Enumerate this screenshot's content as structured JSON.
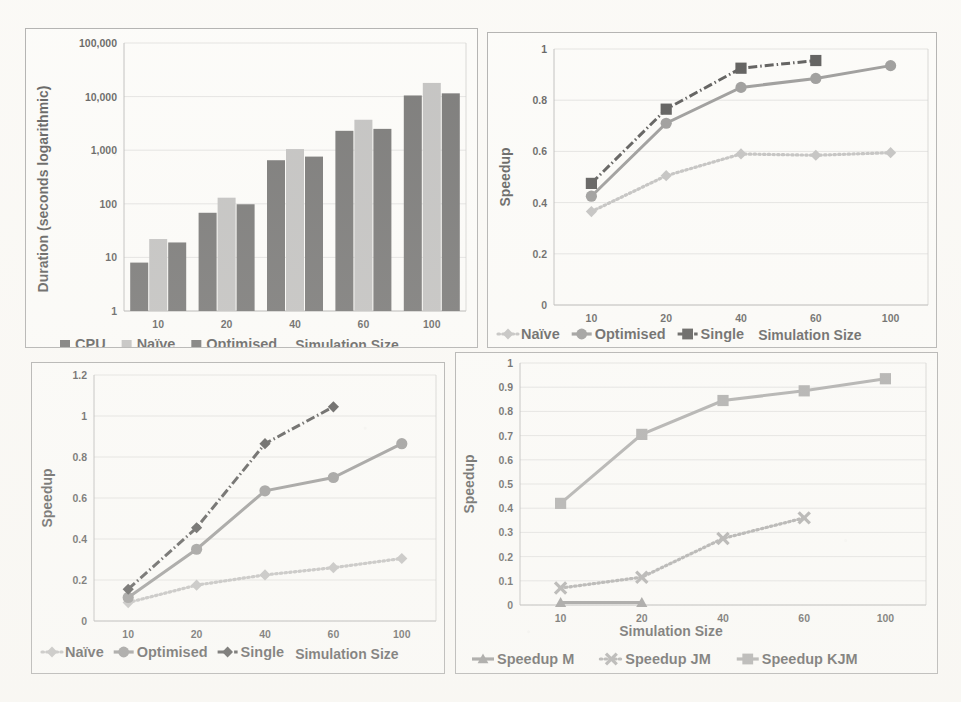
{
  "page": {
    "background_color": "#fbfaf7",
    "panel_background": "#fdfdfb",
    "panel_border_color": "#8f8f8f",
    "layout": "2x2 grid of charts on a scanned page"
  },
  "palette": {
    "dark_gray": "#3b3b3b",
    "light_gray": "#a8a8a8",
    "mid_gray": "#6f6f6f",
    "black": "#111111",
    "gridline": "#cfcfcf",
    "axis": "#9a9a9a"
  },
  "charts": [
    {
      "id": "duration-bar-chart",
      "position": "top-left",
      "chart_data": {
        "type": "bar",
        "title": "",
        "xlabel": "Simulation Size",
        "ylabel": "Duration (seconds logarithmic)",
        "categories": [
          "10",
          "20",
          "40",
          "60",
          "100"
        ],
        "yscale": "log",
        "ylim": [
          1,
          100000
        ],
        "yticks": [
          "1",
          "10",
          "100",
          "1,000",
          "10,000",
          "100,000"
        ],
        "ytick_values": [
          1,
          10,
          100,
          1000,
          10000,
          100000
        ],
        "grid": true,
        "legend_position": "bottom-left",
        "series": [
          {
            "name": "CPU",
            "color": "#3b3b3b",
            "marker": "square",
            "values": [
              8,
              68,
              650,
              2300,
              10500
            ]
          },
          {
            "name": "Naïve",
            "color": "#a8a8a8",
            "marker": "square",
            "values": [
              22,
              130,
              1050,
              3700,
              18000
            ]
          },
          {
            "name": "Optimised",
            "color": "#3b3b3b",
            "marker": "square",
            "values": [
              19,
              98,
              760,
              2500,
              11500
            ]
          }
        ]
      }
    },
    {
      "id": "speedup-multi-chart",
      "position": "top-right",
      "chart_data": {
        "type": "line",
        "title": "",
        "xlabel": "Simulation Size",
        "ylabel": "Speedup",
        "categories": [
          "10",
          "20",
          "40",
          "60",
          "100"
        ],
        "ylim": [
          0,
          1
        ],
        "yticks": [
          "0",
          "0.2",
          "0.4",
          "0.6",
          "0.8",
          "1"
        ],
        "ytick_values": [
          0,
          0.2,
          0.4,
          0.6,
          0.8,
          1
        ],
        "grid": true,
        "legend_position": "bottom-left",
        "series": [
          {
            "name": "Naïve",
            "color": "#a8a8a8",
            "marker": "diamond",
            "style": "dotted",
            "values": [
              0.365,
              0.505,
              0.59,
              0.585,
              0.595
            ]
          },
          {
            "name": "Optimised",
            "color": "#6f6f6f",
            "marker": "circle",
            "style": "solid",
            "values": [
              0.425,
              0.71,
              0.85,
              0.885,
              0.935
            ]
          },
          {
            "name": "Single",
            "color": "#111111",
            "marker": "square",
            "style": "dashdot",
            "values": [
              0.475,
              0.765,
              0.925,
              0.955,
              null
            ]
          }
        ]
      }
    },
    {
      "id": "speedup-scaling-chart",
      "position": "bottom-left",
      "chart_data": {
        "type": "line",
        "title": "",
        "xlabel": "Simulation Size",
        "ylabel": "Speedup",
        "categories": [
          "10",
          "20",
          "40",
          "60",
          "100"
        ],
        "ylim": [
          0,
          1.2
        ],
        "yticks": [
          "0",
          "0.2",
          "0.4",
          "0.6",
          "0.8",
          "1",
          "1.2"
        ],
        "ytick_values": [
          0,
          0.2,
          0.4,
          0.6,
          0.8,
          1,
          1.2
        ],
        "grid": true,
        "legend_position": "bottom-left",
        "series": [
          {
            "name": "Naïve",
            "color": "#a8a8a8",
            "marker": "diamond",
            "style": "dotted",
            "values": [
              0.09,
              0.175,
              0.225,
              0.26,
              0.305
            ]
          },
          {
            "name": "Optimised",
            "color": "#6f6f6f",
            "marker": "circle",
            "style": "solid",
            "values": [
              0.115,
              0.35,
              0.635,
              0.7,
              0.865
            ]
          },
          {
            "name": "Single",
            "color": "#111111",
            "marker": "diamond",
            "style": "dashdot",
            "values": [
              0.155,
              0.455,
              0.865,
              1.045,
              null
            ]
          }
        ]
      }
    },
    {
      "id": "speedup-mjm-chart",
      "position": "bottom-right",
      "chart_data": {
        "type": "line",
        "title": "",
        "xlabel": "Simulation Size",
        "ylabel": "Speedup",
        "categories": [
          "10",
          "20",
          "40",
          "60",
          "100"
        ],
        "ylim": [
          0,
          1
        ],
        "yticks": [
          "0",
          "0.1",
          "0.2",
          "0.3",
          "0.4",
          "0.5",
          "0.6",
          "0.7",
          "0.8",
          "0.9",
          "1"
        ],
        "ytick_values": [
          0,
          0.1,
          0.2,
          0.3,
          0.4,
          0.5,
          0.6,
          0.7,
          0.8,
          0.9,
          1
        ],
        "grid": true,
        "legend_position": "bottom",
        "series": [
          {
            "name": "Speedup M",
            "color": "#6f6f6f",
            "marker": "triangle",
            "style": "solid",
            "values": [
              0.01,
              0.01,
              null,
              null,
              null
            ]
          },
          {
            "name": "Speedup JM",
            "color": "#8a8a8a",
            "marker": "x",
            "style": "dotted",
            "values": [
              0.07,
              0.115,
              0.275,
              0.36,
              null
            ]
          },
          {
            "name": "Speedup KJM",
            "color": "#8a8a8a",
            "marker": "square",
            "style": "solid",
            "values": [
              0.42,
              0.705,
              0.845,
              0.885,
              0.935
            ]
          }
        ]
      }
    }
  ]
}
